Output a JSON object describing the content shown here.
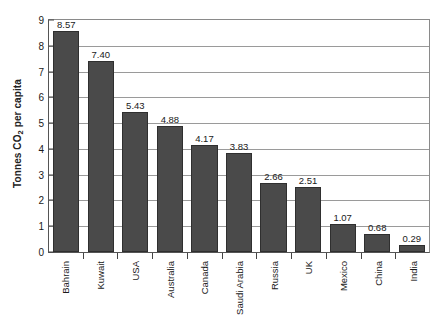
{
  "chart_data": {
    "type": "bar",
    "title": "",
    "xlabel": "",
    "ylabel": "Tonnes CO2 per capita",
    "ylabel_prefix": "Tonnes CO",
    "ylabel_sub": "2",
    "ylabel_suffix": " per capita",
    "ylim": [
      0,
      9
    ],
    "ytick_step": 1,
    "yticks": [
      "0",
      "1",
      "2",
      "3",
      "4",
      "5",
      "6",
      "7",
      "8",
      "9"
    ],
    "grid": "horizontal",
    "legend": "none",
    "orientation": "vertical",
    "label_rotation_deg": 90,
    "bar_color": "#4a4a4a",
    "bar_edge_color": "#2f2f2f",
    "gridline_color": "#9a9a9a",
    "plot_background": "#ffffff",
    "categories": [
      "Bahrain",
      "Kuwait",
      "USA",
      "Australia",
      "Canada",
      "Saudi Arabia",
      "Russia",
      "UK",
      "Mexico",
      "China",
      "India"
    ],
    "values": [
      8.57,
      7.4,
      5.43,
      4.88,
      4.17,
      3.83,
      2.66,
      2.51,
      1.07,
      0.68,
      0.29
    ],
    "value_labels": [
      "8.57",
      "7.40",
      "5.43",
      "4.88",
      "4.17",
      "3.83",
      "2.66",
      "2.51",
      "1.07",
      "0.68",
      "0.29"
    ]
  }
}
